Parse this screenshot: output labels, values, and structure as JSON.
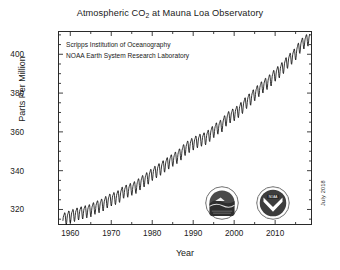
{
  "chart_data": {
    "type": "line",
    "title": "Atmospheric CO2 at Mauna Loa Observatory",
    "title_main": "Atmospheric CO",
    "title_sub": "2",
    "title_rest": " at Mauna Loa Observatory",
    "xlabel": "Year",
    "ylabel": "Parts Per Million",
    "xlim": [
      1957,
      2019
    ],
    "ylim": [
      312,
      412
    ],
    "xticks": [
      1960,
      1970,
      1980,
      1990,
      2000,
      2010
    ],
    "yticks": [
      320,
      340,
      360,
      380,
      400
    ],
    "xminor_step": 5,
    "yminor_step": 5,
    "grid": false,
    "legend": "none",
    "series_name": "Monthly mean CO2 concentration",
    "line_color": "#111111",
    "annotations": [
      "Scripps Institution of Oceanography",
      "NOAA Earth System Research Laboratory"
    ],
    "datestamp": "July 2018",
    "seasonal_amplitude_ppm": 3.0,
    "x": [
      1958.2,
      1959,
      1960,
      1961,
      1962,
      1963,
      1964,
      1965,
      1966,
      1967,
      1968,
      1969,
      1970,
      1971,
      1972,
      1973,
      1974,
      1975,
      1976,
      1977,
      1978,
      1979,
      1980,
      1981,
      1982,
      1983,
      1984,
      1985,
      1986,
      1987,
      1988,
      1989,
      1990,
      1991,
      1992,
      1993,
      1994,
      1995,
      1996,
      1997,
      1998,
      1999,
      2000,
      2001,
      2002,
      2003,
      2004,
      2005,
      2006,
      2007,
      2008,
      2009,
      2010,
      2011,
      2012,
      2013,
      2014,
      2015,
      2016,
      2017,
      2018.5
    ],
    "values": [
      315.3,
      315.9,
      316.9,
      317.6,
      318.4,
      318.9,
      319.5,
      320.0,
      321.3,
      322.1,
      323.0,
      324.6,
      325.6,
      326.3,
      327.4,
      329.6,
      330.1,
      331.1,
      332.0,
      333.8,
      335.4,
      336.8,
      338.7,
      340.1,
      341.4,
      343.0,
      344.6,
      346.0,
      347.4,
      349.2,
      351.6,
      353.1,
      354.4,
      355.6,
      356.4,
      357.1,
      358.8,
      360.8,
      362.6,
      363.7,
      366.7,
      368.4,
      369.5,
      371.1,
      373.2,
      375.8,
      377.5,
      379.8,
      381.9,
      383.8,
      385.6,
      387.4,
      389.9,
      391.6,
      393.8,
      396.5,
      398.6,
      400.8,
      404.2,
      406.5,
      408.7
    ]
  },
  "logos": [
    {
      "name": "scripps-institution-logo",
      "alt": "Scripps Institution of Oceanography seal"
    },
    {
      "name": "noaa-logo",
      "alt": "NOAA emblem"
    }
  ]
}
